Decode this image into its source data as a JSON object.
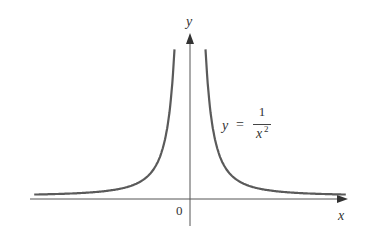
{
  "chart_data": {
    "type": "line",
    "title": "",
    "function": "y = 1/x^2",
    "xlabel": "x",
    "ylabel": "y",
    "origin_label": "0",
    "annotation": {
      "lhs": "y",
      "eq": "=",
      "numerator": "1",
      "denominator": "x",
      "exponent": "2"
    },
    "grid": false,
    "legend": "none",
    "series": [
      {
        "name": "y = 1/x^2",
        "color": "#555555",
        "x": [
          -4,
          -3,
          -2,
          -1.5,
          -1,
          -0.8,
          -0.6,
          -0.5,
          -0.45,
          -0.4,
          0.4,
          0.45,
          0.5,
          0.6,
          0.8,
          1,
          1.5,
          2,
          3,
          4
        ],
        "y": [
          0.0625,
          0.111,
          0.25,
          0.444,
          1,
          1.5625,
          2.778,
          4,
          4.94,
          6.25,
          6.25,
          4.94,
          4,
          2.778,
          1.5625,
          1,
          0.444,
          0.25,
          0.111,
          0.0625
        ]
      }
    ]
  }
}
